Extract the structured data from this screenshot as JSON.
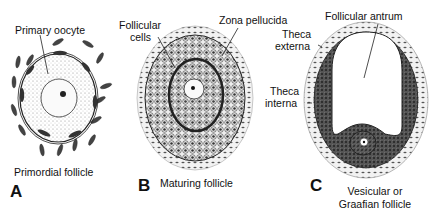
{
  "figure": {
    "panels": [
      {
        "letter": "A",
        "caption": "Primordial follicle",
        "labels": [
          "Primary oocyte"
        ]
      },
      {
        "letter": "B",
        "caption": "Maturing follicle",
        "labels": [
          "Follicular",
          "cells",
          "Zona pellucida"
        ]
      },
      {
        "letter": "C",
        "caption_line1": "Vesicular or",
        "caption_line2": "Graafian follicle",
        "labels": [
          "Follicular antrum",
          "Theca",
          "externa",
          "Theca",
          "interna"
        ]
      }
    ]
  }
}
